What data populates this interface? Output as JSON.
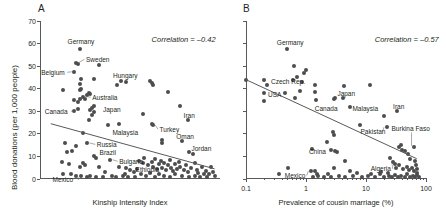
{
  "figure": {
    "panels": [
      {
        "letter": "A",
        "ylabel": "Blood donations (per 1,000 people)",
        "xlabel": "Kinship Intensity Index",
        "annotation": "Correlation = –0.42",
        "yticks": [
          "0",
          "10",
          "20",
          "30",
          "40",
          "50",
          "60",
          "70"
        ],
        "xticks": [],
        "labels": [
          "Germany",
          "Sweden",
          "Belgium",
          "Hungary",
          "Australia",
          "Canada",
          "Japan",
          "Malaysia",
          "Iran",
          "Turkey",
          "Oman",
          "Jordan",
          "Russia",
          "Brazil",
          "Bulgaria",
          "Mexico",
          "Ethiopia"
        ]
      },
      {
        "letter": "B",
        "ylabel": "",
        "xlabel": "Prevalence of cousin marriage (%)",
        "annotation": "Correlation = –0.57",
        "yticks": [],
        "xticks": [
          "0.1",
          "1",
          "10",
          "100"
        ],
        "labels": [
          "Germany",
          "Czech Rep.",
          "USA",
          "Canada",
          "Japan",
          "Malaysia",
          "Iran",
          "Pakistan",
          "Burkina Faso",
          "China",
          "Mexico",
          "Algeria"
        ]
      }
    ]
  },
  "chart_data": [
    {
      "type": "scatter",
      "title": "A",
      "xlabel": "Kinship Intensity Index",
      "ylabel": "Blood donations (per 1,000 people)",
      "xscale": "linear",
      "yscale": "linear",
      "xlim": [
        0,
        100
      ],
      "ylim": [
        0,
        70
      ],
      "yticks": [
        0,
        10,
        20,
        30,
        40,
        50,
        60,
        70
      ],
      "xticks": [],
      "grid": false,
      "legend": null,
      "annotations": [
        {
          "text": "Correlation = –0.42",
          "x": 62,
          "y": 62
        }
      ],
      "correlation": -0.42,
      "trendline": {
        "x": [
          6,
          97
        ],
        "y": [
          24.5,
          4.5
        ]
      },
      "labeled_points": [
        {
          "label": "Germany",
          "x": 22,
          "y": 57.5
        },
        {
          "label": "Sweden",
          "x": 20,
          "y": 51.5
        },
        {
          "label": "Belgium",
          "x": 19,
          "y": 47.5
        },
        {
          "label": "Hungary",
          "x": 45,
          "y": 43.5
        },
        {
          "label": "Australia",
          "x": 24,
          "y": 36.5
        },
        {
          "label": "Canada",
          "x": 21,
          "y": 31.0
        },
        {
          "label": "Japan",
          "x": 30,
          "y": 31.5
        },
        {
          "label": "Malaysia",
          "x": 38,
          "y": 24.0
        },
        {
          "label": "Turkey",
          "x": 62,
          "y": 24.5
        },
        {
          "label": "Iran",
          "x": 82,
          "y": 26.0
        },
        {
          "label": "Oman",
          "x": 79,
          "y": 17.0
        },
        {
          "label": "Jordan",
          "x": 83,
          "y": 12.0
        },
        {
          "label": "Russia",
          "x": 26,
          "y": 16.0
        },
        {
          "label": "Brazil",
          "x": 32,
          "y": 10.0
        },
        {
          "label": "Bulgaria",
          "x": 39,
          "y": 8.5
        },
        {
          "label": "Mexico",
          "x": 22,
          "y": 2.0
        },
        {
          "label": "Ethiopia",
          "x": 52,
          "y": 3.0
        }
      ],
      "points": [
        {
          "x": 22,
          "y": 57.5
        },
        {
          "x": 20,
          "y": 51.5
        },
        {
          "x": 21,
          "y": 51.0
        },
        {
          "x": 33,
          "y": 50.5
        },
        {
          "x": 19,
          "y": 47.5
        },
        {
          "x": 23,
          "y": 44.5
        },
        {
          "x": 30,
          "y": 44.5
        },
        {
          "x": 45,
          "y": 43.5
        },
        {
          "x": 48,
          "y": 43.0
        },
        {
          "x": 61,
          "y": 43.5
        },
        {
          "x": 62,
          "y": 42.5
        },
        {
          "x": 43,
          "y": 41.5
        },
        {
          "x": 22,
          "y": 42.0
        },
        {
          "x": 23,
          "y": 40.0
        },
        {
          "x": 22,
          "y": 39.5
        },
        {
          "x": 13,
          "y": 39.5
        },
        {
          "x": 27,
          "y": 38.0
        },
        {
          "x": 28,
          "y": 37.5
        },
        {
          "x": 26,
          "y": 37.0
        },
        {
          "x": 24,
          "y": 36.5
        },
        {
          "x": 63,
          "y": 41.5
        },
        {
          "x": 71,
          "y": 38.5
        },
        {
          "x": 22,
          "y": 35.5
        },
        {
          "x": 19,
          "y": 35.0
        },
        {
          "x": 25,
          "y": 35.5
        },
        {
          "x": 21,
          "y": 34.0
        },
        {
          "x": 30,
          "y": 32.5
        },
        {
          "x": 29,
          "y": 31.5
        },
        {
          "x": 21,
          "y": 31.0
        },
        {
          "x": 19,
          "y": 30.0
        },
        {
          "x": 28,
          "y": 30.5
        },
        {
          "x": 30,
          "y": 29.5
        },
        {
          "x": 29,
          "y": 28.5
        },
        {
          "x": 78,
          "y": 32.5
        },
        {
          "x": 57,
          "y": 29.0
        },
        {
          "x": 82,
          "y": 26.0
        },
        {
          "x": 27,
          "y": 26.0
        },
        {
          "x": 38,
          "y": 24.0
        },
        {
          "x": 44,
          "y": 24.5
        },
        {
          "x": 62,
          "y": 24.5
        },
        {
          "x": 63,
          "y": 24.0
        },
        {
          "x": 24,
          "y": 20.5
        },
        {
          "x": 68,
          "y": 17.5
        },
        {
          "x": 68,
          "y": 16.0
        },
        {
          "x": 79,
          "y": 17.0
        },
        {
          "x": 26,
          "y": 16.0
        },
        {
          "x": 14,
          "y": 16.0
        },
        {
          "x": 20,
          "y": 14.5
        },
        {
          "x": 83,
          "y": 12.0
        },
        {
          "x": 85,
          "y": 11.0
        },
        {
          "x": 15,
          "y": 12.0
        },
        {
          "x": 18,
          "y": 12.5
        },
        {
          "x": 30,
          "y": 10.0
        },
        {
          "x": 31,
          "y": 9.5
        },
        {
          "x": 39,
          "y": 8.5
        },
        {
          "x": 12,
          "y": 7.5
        },
        {
          "x": 16,
          "y": 6.5
        },
        {
          "x": 24,
          "y": 7.0
        },
        {
          "x": 25,
          "y": 6.0
        },
        {
          "x": 22,
          "y": 5.5
        },
        {
          "x": 44,
          "y": 5.5
        },
        {
          "x": 48,
          "y": 5.0
        },
        {
          "x": 52,
          "y": 3.0
        },
        {
          "x": 55,
          "y": 8.0
        },
        {
          "x": 57,
          "y": 7.0
        },
        {
          "x": 58,
          "y": 9.5
        },
        {
          "x": 60,
          "y": 6.0
        },
        {
          "x": 62,
          "y": 7.5
        },
        {
          "x": 63,
          "y": 5.5
        },
        {
          "x": 64,
          "y": 9.0
        },
        {
          "x": 65,
          "y": 4.5
        },
        {
          "x": 66,
          "y": 6.5
        },
        {
          "x": 67,
          "y": 8.0
        },
        {
          "x": 68,
          "y": 5.0
        },
        {
          "x": 69,
          "y": 7.0
        },
        {
          "x": 70,
          "y": 4.0
        },
        {
          "x": 71,
          "y": 6.0
        },
        {
          "x": 72,
          "y": 8.5
        },
        {
          "x": 73,
          "y": 5.0
        },
        {
          "x": 74,
          "y": 3.5
        },
        {
          "x": 75,
          "y": 6.5
        },
        {
          "x": 76,
          "y": 4.5
        },
        {
          "x": 77,
          "y": 7.5
        },
        {
          "x": 78,
          "y": 5.5
        },
        {
          "x": 80,
          "y": 4.0
        },
        {
          "x": 81,
          "y": 6.0
        },
        {
          "x": 82,
          "y": 3.0
        },
        {
          "x": 84,
          "y": 5.0
        },
        {
          "x": 86,
          "y": 7.0
        },
        {
          "x": 87,
          "y": 4.0
        },
        {
          "x": 88,
          "y": 2.5
        },
        {
          "x": 90,
          "y": 5.5
        },
        {
          "x": 92,
          "y": 3.5
        },
        {
          "x": 94,
          "y": 2.0
        },
        {
          "x": 95,
          "y": 5.5
        },
        {
          "x": 96,
          "y": 3.0
        },
        {
          "x": 53,
          "y": 1.0
        },
        {
          "x": 56,
          "y": 2.0
        },
        {
          "x": 59,
          "y": 1.5
        },
        {
          "x": 61,
          "y": 2.5
        },
        {
          "x": 64,
          "y": 1.0
        },
        {
          "x": 66,
          "y": 2.0
        },
        {
          "x": 69,
          "y": 1.5
        },
        {
          "x": 72,
          "y": 1.0
        },
        {
          "x": 75,
          "y": 2.0
        },
        {
          "x": 79,
          "y": 1.5
        },
        {
          "x": 83,
          "y": 1.0
        },
        {
          "x": 86,
          "y": 1.5
        },
        {
          "x": 89,
          "y": 1.0
        },
        {
          "x": 91,
          "y": 2.0
        },
        {
          "x": 93,
          "y": 1.0
        },
        {
          "x": 97,
          "y": 1.5
        },
        {
          "x": 35,
          "y": 1.0
        },
        {
          "x": 40,
          "y": 1.5
        },
        {
          "x": 42,
          "y": 0.8
        },
        {
          "x": 46,
          "y": 1.2
        },
        {
          "x": 49,
          "y": 0.8
        },
        {
          "x": 26,
          "y": 1.0
        },
        {
          "x": 28,
          "y": 1.5
        },
        {
          "x": 31,
          "y": 0.8
        },
        {
          "x": 23,
          "y": 1.2
        },
        {
          "x": 20,
          "y": 1.5
        },
        {
          "x": 17,
          "y": 2.0
        },
        {
          "x": 13,
          "y": 2.0
        },
        {
          "x": 33,
          "y": 5.5
        },
        {
          "x": 36,
          "y": 3.0
        },
        {
          "x": 47,
          "y": 2.0
        },
        {
          "x": 50,
          "y": 4.0
        },
        {
          "x": 54,
          "y": 4.5
        }
      ]
    },
    {
      "type": "scatter",
      "title": "B",
      "xlabel": "Prevalence of cousin marriage (%)",
      "ylabel": "Blood donations (per 1,000 people)",
      "xscale": "log",
      "yscale": "linear",
      "xlim": [
        0.1,
        100
      ],
      "ylim": [
        0,
        70
      ],
      "xticks": [
        0.1,
        1,
        10,
        100
      ],
      "yticks": [
        0,
        10,
        20,
        30,
        40,
        50,
        60,
        70
      ],
      "grid": false,
      "legend": null,
      "annotations": [
        {
          "text": "Correlation = –0.57",
          "x": 14,
          "y": 62
        }
      ],
      "correlation": -0.57,
      "trendline": {
        "x": [
          0.1,
          70
        ],
        "y": [
          44.0,
          9.0
        ]
      },
      "labeled_points": [
        {
          "label": "Germany",
          "x": 0.48,
          "y": 57.5
        },
        {
          "label": "Czech Rep.",
          "x": 0.2,
          "y": 44.0
        },
        {
          "label": "USA",
          "x": 0.2,
          "y": 38.0
        },
        {
          "label": "Canada",
          "x": 1.4,
          "y": 35.0
        },
        {
          "label": "Japan",
          "x": 4.2,
          "y": 36.0
        },
        {
          "label": "Malaysia",
          "x": 5.5,
          "y": 32.0
        },
        {
          "label": "Iran",
          "x": 33,
          "y": 30.0
        },
        {
          "label": "Pakistan",
          "x": 22,
          "y": 23.0
        },
        {
          "label": "Burkina Faso",
          "x": 62,
          "y": 14.0
        },
        {
          "label": "China",
          "x": 2.6,
          "y": 13.0
        },
        {
          "label": "Mexico",
          "x": 1.2,
          "y": 3.5
        },
        {
          "label": "Algeria",
          "x": 30,
          "y": 6.5
        }
      ],
      "points": [
        {
          "x": 0.48,
          "y": 57.5
        },
        {
          "x": 0.62,
          "y": 50.0
        },
        {
          "x": 1.0,
          "y": 48.5
        },
        {
          "x": 0.72,
          "y": 45.0
        },
        {
          "x": 0.92,
          "y": 47.0
        },
        {
          "x": 0.6,
          "y": 44.0
        },
        {
          "x": 0.85,
          "y": 43.0
        },
        {
          "x": 0.1,
          "y": 44.0
        },
        {
          "x": 0.2,
          "y": 44.0
        },
        {
          "x": 0.22,
          "y": 41.5
        },
        {
          "x": 0.2,
          "y": 38.0
        },
        {
          "x": 0.2,
          "y": 34.5
        },
        {
          "x": 0.45,
          "y": 38.0
        },
        {
          "x": 0.8,
          "y": 39.0
        },
        {
          "x": 1.4,
          "y": 38.5
        },
        {
          "x": 1.45,
          "y": 35.0
        },
        {
          "x": 1.4,
          "y": 41.5
        },
        {
          "x": 0.65,
          "y": 36.0
        },
        {
          "x": 4.2,
          "y": 36.0
        },
        {
          "x": 4.3,
          "y": 41.0
        },
        {
          "x": 11.5,
          "y": 41.5
        },
        {
          "x": 5.5,
          "y": 32.0
        },
        {
          "x": 2.9,
          "y": 35.5
        },
        {
          "x": 3.0,
          "y": 36.0
        },
        {
          "x": 33,
          "y": 30.0
        },
        {
          "x": 20,
          "y": 28.0
        },
        {
          "x": 8.0,
          "y": 24.0
        },
        {
          "x": 22,
          "y": 23.0
        },
        {
          "x": 2.8,
          "y": 21.0
        },
        {
          "x": 2.9,
          "y": 19.5
        },
        {
          "x": 2.2,
          "y": 16.5
        },
        {
          "x": 2.6,
          "y": 13.0
        },
        {
          "x": 1.25,
          "y": 13.5
        },
        {
          "x": 3.1,
          "y": 12.5
        },
        {
          "x": 3.3,
          "y": 12.0
        },
        {
          "x": 4.4,
          "y": 8.0
        },
        {
          "x": 0.5,
          "y": 5.0
        },
        {
          "x": 1.2,
          "y": 3.5
        },
        {
          "x": 1.4,
          "y": 3.5
        },
        {
          "x": 2.9,
          "y": 5.0
        },
        {
          "x": 5.5,
          "y": 3.5
        },
        {
          "x": 30,
          "y": 6.5
        },
        {
          "x": 35,
          "y": 14.0
        },
        {
          "x": 38,
          "y": 15.0
        },
        {
          "x": 40,
          "y": 13.0
        },
        {
          "x": 45,
          "y": 12.5
        },
        {
          "x": 50,
          "y": 11.0
        },
        {
          "x": 55,
          "y": 9.0
        },
        {
          "x": 62,
          "y": 14.0
        },
        {
          "x": 65,
          "y": 8.0
        },
        {
          "x": 68,
          "y": 6.0
        },
        {
          "x": 25,
          "y": 9.5
        },
        {
          "x": 28,
          "y": 7.5
        },
        {
          "x": 32,
          "y": 5.0
        },
        {
          "x": 36,
          "y": 6.0
        },
        {
          "x": 42,
          "y": 4.5
        },
        {
          "x": 48,
          "y": 5.5
        },
        {
          "x": 52,
          "y": 4.0
        },
        {
          "x": 58,
          "y": 5.0
        },
        {
          "x": 63,
          "y": 3.5
        },
        {
          "x": 70,
          "y": 4.5
        },
        {
          "x": 72,
          "y": 2.5
        },
        {
          "x": 1.3,
          "y": 1.0
        },
        {
          "x": 1.6,
          "y": 1.2
        },
        {
          "x": 2.0,
          "y": 0.8
        },
        {
          "x": 2.6,
          "y": 1.0
        },
        {
          "x": 3.5,
          "y": 1.5
        },
        {
          "x": 4.5,
          "y": 1.0
        },
        {
          "x": 6.0,
          "y": 1.2
        },
        {
          "x": 8.5,
          "y": 1.0
        },
        {
          "x": 11,
          "y": 1.5
        },
        {
          "x": 14,
          "y": 1.0
        },
        {
          "x": 17,
          "y": 2.0
        },
        {
          "x": 20,
          "y": 1.0
        },
        {
          "x": 24,
          "y": 1.5
        },
        {
          "x": 27,
          "y": 1.0
        },
        {
          "x": 31,
          "y": 1.8
        },
        {
          "x": 34,
          "y": 1.0
        },
        {
          "x": 39,
          "y": 1.5
        },
        {
          "x": 44,
          "y": 1.0
        },
        {
          "x": 49,
          "y": 2.0
        },
        {
          "x": 54,
          "y": 1.0
        },
        {
          "x": 60,
          "y": 1.5
        },
        {
          "x": 66,
          "y": 1.0
        },
        {
          "x": 71,
          "y": 1.8
        },
        {
          "x": 75,
          "y": 1.0
        },
        {
          "x": 1.5,
          "y": 2.2
        },
        {
          "x": 2.3,
          "y": 2.0
        },
        {
          "x": 7.0,
          "y": 2.5
        },
        {
          "x": 12,
          "y": 2.2
        },
        {
          "x": 18,
          "y": 3.0
        },
        {
          "x": 23,
          "y": 2.5
        },
        {
          "x": 0.35,
          "y": 2.0
        }
      ]
    }
  ]
}
